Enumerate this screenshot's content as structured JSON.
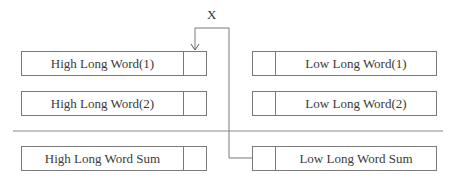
{
  "diagram": {
    "connector_label": "X",
    "left_column": [
      {
        "label": "High Long Word(1)"
      },
      {
        "label": "High Long Word(2)"
      },
      {
        "label": "High Long Word Sum"
      }
    ],
    "right_column": [
      {
        "label": "Low Long Word(1)"
      },
      {
        "label": "Low Long Word(2)"
      },
      {
        "label": "Low Long Word Sum"
      }
    ],
    "colors": {
      "line": "#7a7a7a",
      "text": "#3a3a3a",
      "background": "#ffffff"
    }
  }
}
